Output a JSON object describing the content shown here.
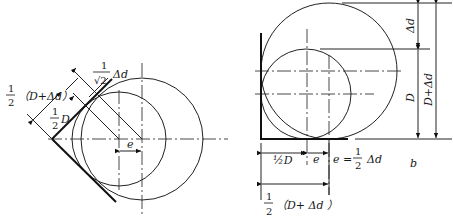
{
  "left_diagram": {
    "label_half_D_plus_dd": "1/2（D+Δd）",
    "frac_num": "1",
    "frac_den": "2",
    "paren_text": "（D+Δd）",
    "half_D_var": "D",
    "root2_num": "1",
    "root2_den": "√2",
    "root2_suffix": "Δd",
    "e_label": "e"
  },
  "right_diagram": {
    "dd_label": "Δd",
    "D_label": "D",
    "D_plus_dd_label": "D+Δd",
    "half_D_label": "½D",
    "e_label": "e",
    "e_eq_prefix": "e =",
    "e_eq_num": "1",
    "e_eq_den": "2",
    "e_eq_suffix": "Δd",
    "bottom_frac_num": "1",
    "bottom_frac_den": "2",
    "bottom_paren": "（D+ Δd ）",
    "figure_tag": "b"
  }
}
